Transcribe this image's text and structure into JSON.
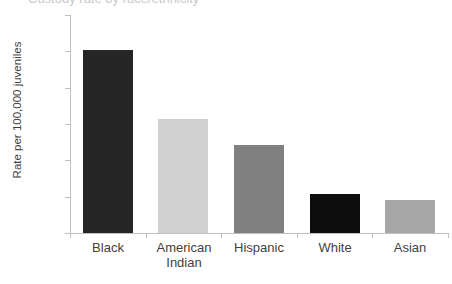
{
  "chart_data": {
    "type": "bar",
    "title": "",
    "xlabel": "",
    "ylabel": "Rate per 100,000 juveniles",
    "categories": [
      "Black",
      "American Indian",
      "Hispanic",
      "White",
      "Asian"
    ],
    "category_lines": [
      [
        "Black"
      ],
      [
        "American",
        "Indian"
      ],
      [
        "Hispanic"
      ],
      [
        "White"
      ],
      [
        "Asian"
      ]
    ],
    "values": [
      1005,
      630,
      485,
      215,
      180
    ],
    "bar_colors": [
      "#262626",
      "#d0d0d0",
      "#808080",
      "#0d0d0d",
      "#a6a6a6"
    ],
    "ylim": [
      0,
      1200
    ],
    "ytick_values": [
      0,
      200,
      400,
      600,
      800,
      1000,
      1200
    ],
    "ytick_labels": [
      "0",
      "200",
      "400",
      "600",
      "800",
      "1000",
      "1200"
    ],
    "grid": false,
    "legend": "none"
  },
  "axis": {
    "y_title": "Rate per 100,000 juveniles"
  },
  "title_crop": {
    "text": "Custody rate by race/ethnicity"
  },
  "colors": {
    "axis_line": "#bfbfbf",
    "text": "#3f3f3f",
    "background": "#ffffff"
  }
}
